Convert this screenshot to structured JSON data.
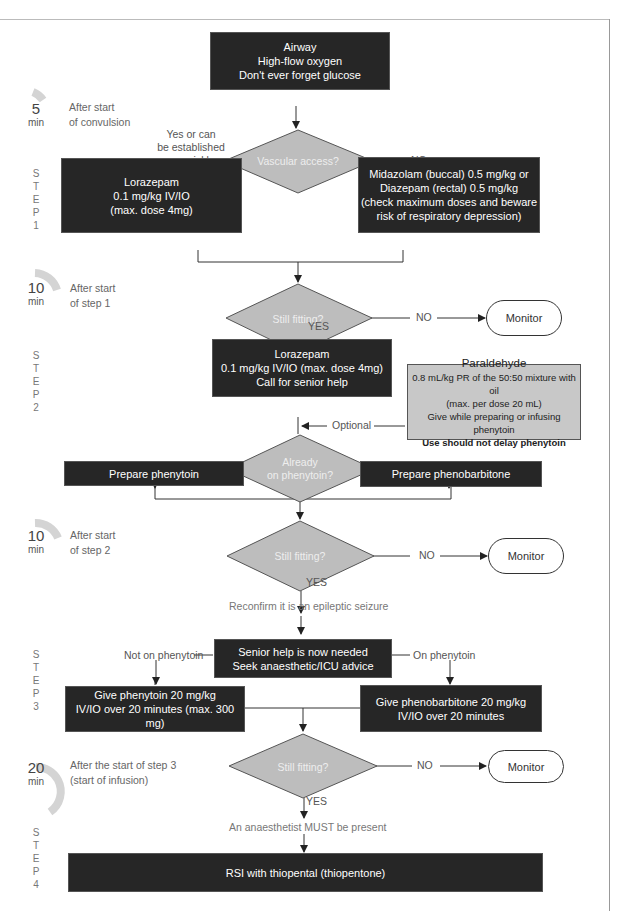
{
  "timeline": [
    {
      "minutes": "5",
      "unit": "min",
      "desc_line1": "After start",
      "desc_line2": "of convulsion"
    },
    {
      "minutes": "10",
      "unit": "min",
      "desc_line1": "After start",
      "desc_line2": "of step 1"
    },
    {
      "minutes": "10",
      "unit": "min",
      "desc_line1": "After start",
      "desc_line2": "of step 2"
    },
    {
      "minutes": "20",
      "unit": "min",
      "desc_line1": "After the start of step 3",
      "desc_line2": "(start of infusion)"
    }
  ],
  "steps": [
    {
      "letters": [
        "S",
        "T",
        "E",
        "P",
        "1"
      ]
    },
    {
      "letters": [
        "S",
        "T",
        "E",
        "P",
        "2"
      ]
    },
    {
      "letters": [
        "S",
        "T",
        "E",
        "P",
        "3"
      ]
    },
    {
      "letters": [
        "S",
        "T",
        "E",
        "P",
        "4"
      ]
    }
  ],
  "start_box": {
    "line1": "Airway",
    "line2": "High-flow oxygen",
    "line3": "Don't ever forget glucose"
  },
  "decision_vascular": {
    "text": "Vascular access?",
    "yes_label_line1": "Yes or can",
    "yes_label_line2": "be established",
    "yes_label_line3": "quickly",
    "no_label": "NO"
  },
  "step1": {
    "left_box": {
      "line1": "Lorazepam",
      "line2": "0.1 mg/kg IV/IO",
      "line3": "(max. dose 4mg)"
    },
    "right_box": {
      "line1": "Midazolam (buccal) 0.5 mg/kg or",
      "line2": "Diazepam (rectal) 0.5 mg/kg",
      "line3": "(check maximum doses and beware",
      "line4": "risk of respiratory depression)"
    }
  },
  "decision_fitting_1": {
    "text": "Still fitting?",
    "no_label": "NO",
    "yes_label": "YES",
    "monitor": "Monitor"
  },
  "step2": {
    "box": {
      "line1": "Lorazepam",
      "line2": "0.1 mg/kg IV/IO (max. dose 4mg)",
      "line3": "Call for senior help"
    },
    "paraldehyde": {
      "title": "Paraldehyde",
      "line1": "0.8 mL/kg PR of the 50:50 mixture with oil",
      "line2": "(max. per dose 20 mL)",
      "line3": "Give while preparing or infusing phenytoin",
      "line4": "Use should not delay phenytoin"
    },
    "optional_label": "Optional",
    "decision": {
      "line1": "Already",
      "line2": "on phenytoin?",
      "no_label": "NO",
      "yes_label": "YES"
    },
    "prepare_phenytoin": "Prepare phenytoin",
    "prepare_phenobarbitone": "Prepare phenobarbitone"
  },
  "decision_fitting_2": {
    "text": "Still fitting?",
    "no_label": "NO",
    "yes_label": "YES",
    "monitor": "Monitor"
  },
  "reconfirm": "Reconfirm it is an epileptic seizure",
  "step3": {
    "senior_box": {
      "line1": "Senior help is now needed",
      "line2": "Seek anaesthetic/ICU advice"
    },
    "not_on_label": "Not on phenytoin",
    "on_label": "On phenytoin",
    "left_box": {
      "line1": "Give phenytoin 20 mg/kg",
      "line2": "IV/IO over 20 minutes (max. 300 mg)"
    },
    "right_box": {
      "line1": "Give phenobarbitone 20 mg/kg",
      "line2": "IV/IO over 20 minutes"
    }
  },
  "decision_fitting_3": {
    "text": "Still fitting?",
    "no_label": "NO",
    "yes_label": "YES",
    "monitor": "Monitor"
  },
  "anaesthetist": "An anaesthetist MUST be present",
  "step4": {
    "box": "RSI with thiopental (thiopentone)"
  },
  "colors": {
    "box_dark": "#262626",
    "decision_fill": "#bdbdbd",
    "paraldehyde_fill": "#c8c8c8",
    "clock_arc": "#d4d4d4",
    "line": "#333333"
  }
}
